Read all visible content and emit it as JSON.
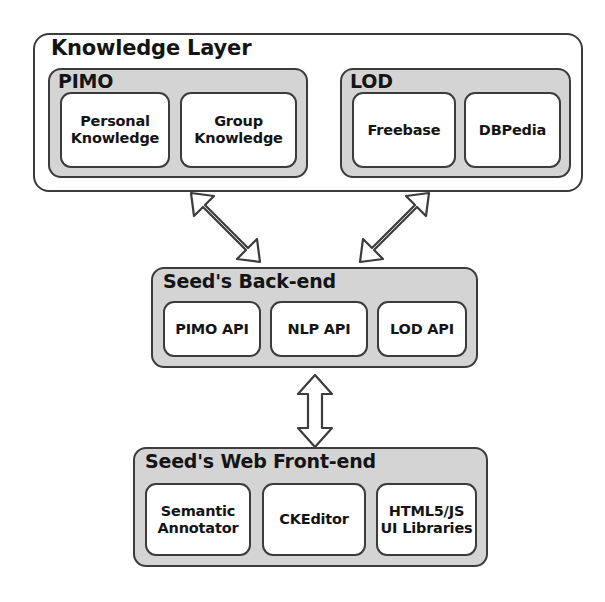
{
  "diagram": {
    "colors": {
      "group_fill": "#d4d4d4",
      "card_fill": "#ffffff",
      "stroke": "#3c3c3c",
      "text": "#141414",
      "background": "#ffffff"
    },
    "layers": [
      {
        "id": "knowledge-layer",
        "label": "Knowledge Layer",
        "groups": [
          {
            "id": "pimo",
            "label": "PIMO",
            "cards": [
              {
                "id": "personal-knowledge",
                "line1": "Personal",
                "line2": "Knowledge"
              },
              {
                "id": "group-knowledge",
                "line1": "Group",
                "line2": "Knowledge"
              }
            ]
          },
          {
            "id": "lod",
            "label": "LOD",
            "cards": [
              {
                "id": "freebase",
                "line1": "Freebase",
                "line2": ""
              },
              {
                "id": "dbpedia",
                "line1": "DBPedia",
                "line2": ""
              }
            ]
          }
        ]
      },
      {
        "id": "backend",
        "label": "Seed's Back-end",
        "cards": [
          {
            "id": "pimo-api",
            "line1": "PIMO API",
            "line2": ""
          },
          {
            "id": "nlp-api",
            "line1": "NLP API",
            "line2": ""
          },
          {
            "id": "lod-api",
            "line1": "LOD API",
            "line2": ""
          }
        ]
      },
      {
        "id": "frontend",
        "label": "Seed's Web Front-end",
        "cards": [
          {
            "id": "semantic-annotator",
            "line1": "Semantic",
            "line2": "Annotator"
          },
          {
            "id": "ckeditor",
            "line1": "CKEditor",
            "line2": ""
          },
          {
            "id": "ui-libraries",
            "line1": "HTML5/JS",
            "line2": "UI Libraries"
          }
        ]
      }
    ],
    "connectors": [
      {
        "id": "kl-backend-left",
        "icon": "double-headed-arrow-diagonal-icon",
        "from": "pimo",
        "to": "backend",
        "direction": "bidirectional",
        "orientation": "diagonal-down-right"
      },
      {
        "id": "kl-backend-right",
        "icon": "double-headed-arrow-diagonal-icon",
        "from": "lod",
        "to": "backend",
        "direction": "bidirectional",
        "orientation": "diagonal-down-left"
      },
      {
        "id": "backend-frontend",
        "icon": "double-headed-arrow-vertical-icon",
        "from": "backend",
        "to": "frontend",
        "direction": "bidirectional",
        "orientation": "vertical"
      }
    ]
  }
}
